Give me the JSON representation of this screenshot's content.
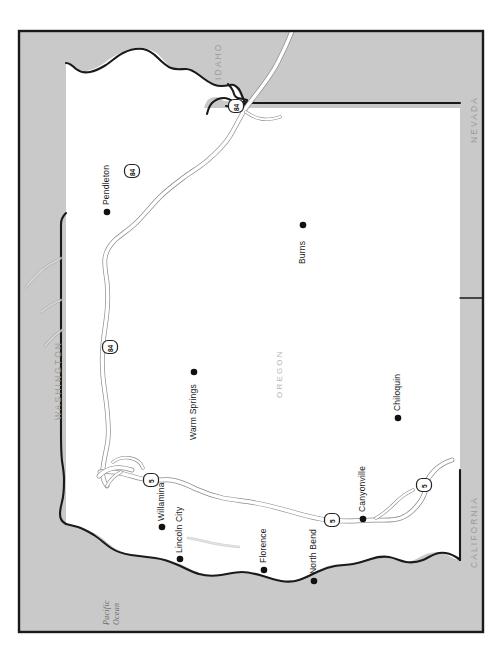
{
  "map": {
    "title_fragment": "",
    "frame": {
      "x": 18,
      "y": 30,
      "width": 466,
      "height": 603
    },
    "background_color": "#ffffff",
    "neighbor_fill": "#c9c9c9",
    "state_fill": "#ffffff",
    "border_color": "#1a1a1a",
    "road_color": "#ffffff",
    "road_casing_color": "#8c8c8c",
    "dot_color": "#111111",
    "orientation_note": "rotated map, labels read bottom-to-top"
  },
  "state_labels": [
    {
      "name": "idaho",
      "text": "IDAHO",
      "x": 213,
      "y": 80,
      "rotate": -90,
      "color": "#9a9a9a"
    },
    {
      "name": "nevada",
      "text": "NEVADA",
      "x": 469,
      "y": 143,
      "rotate": -90,
      "color": "#9a9a9a"
    },
    {
      "name": "washington",
      "text": "WASHINGTON",
      "x": 53,
      "y": 420,
      "rotate": -90,
      "color": "#9a9a9a"
    },
    {
      "name": "california",
      "text": "CALIFORNIA",
      "x": 469,
      "y": 568,
      "rotate": -90,
      "color": "#9a9a9a"
    },
    {
      "name": "oregon",
      "text": "OREGON",
      "x": 275,
      "y": 398,
      "rotate": -90,
      "color": "#b4b4b4"
    }
  ],
  "water_labels": [
    {
      "name": "pacific-ocean",
      "line1": "Pacific",
      "line2": "Ocean",
      "x": 102,
      "y": 625,
      "rotate": -90
    }
  ],
  "cities": [
    {
      "name": "pendleton",
      "label": "Pendleton",
      "dot_x": 107,
      "dot_y": 212,
      "label_x": 101,
      "label_y": 205,
      "rotate": -90
    },
    {
      "name": "burns",
      "label": "Burns",
      "dot_x": 303,
      "dot_y": 225,
      "label_x": 297,
      "label_y": 264,
      "rotate": -90
    },
    {
      "name": "warm-springs",
      "label": "Warm Springs",
      "dot_x": 194,
      "dot_y": 372,
      "label_x": 188,
      "label_y": 440,
      "rotate": -90
    },
    {
      "name": "chiloquin",
      "label": "Chiloquin",
      "dot_x": 398,
      "dot_y": 418,
      "label_x": 392,
      "label_y": 411,
      "rotate": -90
    },
    {
      "name": "willamina",
      "label": "Willamina",
      "dot_x": 162,
      "dot_y": 527,
      "label_x": 156,
      "label_y": 521,
      "rotate": -90
    },
    {
      "name": "lincoln-city",
      "label": "Lincoln City",
      "dot_x": 180,
      "dot_y": 559,
      "label_x": 174,
      "label_y": 553,
      "rotate": -90
    },
    {
      "name": "florence",
      "label": "Florence",
      "dot_x": 264,
      "dot_y": 570,
      "label_x": 258,
      "label_y": 563,
      "rotate": -90
    },
    {
      "name": "north-bend",
      "label": "North Bend",
      "dot_x": 314,
      "dot_y": 581,
      "label_x": 308,
      "label_y": 574,
      "rotate": -90
    },
    {
      "name": "canyonville",
      "label": "Canyonville",
      "dot_x": 363,
      "dot_y": 519,
      "label_x": 357,
      "label_y": 512,
      "rotate": -90
    }
  ],
  "route_shields": [
    {
      "name": "interstate-84-north",
      "number": "84",
      "x": 236,
      "y": 106,
      "type": "interstate"
    },
    {
      "name": "interstate-84-pendleton",
      "number": "84",
      "x": 132,
      "y": 171,
      "type": "interstate"
    },
    {
      "name": "interstate-84-columbia",
      "number": "84",
      "x": 110,
      "y": 347,
      "type": "interstate"
    },
    {
      "name": "interstate-5-north",
      "number": "5",
      "x": 151,
      "y": 480,
      "type": "interstate"
    },
    {
      "name": "interstate-5-canyonville",
      "number": "5",
      "x": 332,
      "y": 520,
      "type": "interstate"
    },
    {
      "name": "interstate-5-south",
      "number": "5",
      "x": 424,
      "y": 485,
      "type": "interstate"
    }
  ]
}
